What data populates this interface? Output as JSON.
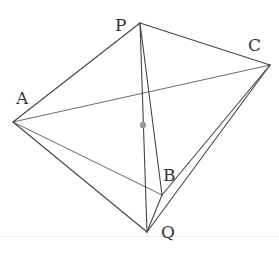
{
  "diagram": {
    "type": "geometry-figure",
    "vertices": {
      "A": {
        "label": "A",
        "x": 13,
        "y": 122,
        "label_x": 16,
        "label_y": 104
      },
      "P": {
        "label": "P",
        "x": 140,
        "y": 23,
        "label_x": 115,
        "label_y": 31
      },
      "C": {
        "label": "C",
        "x": 270,
        "y": 65,
        "label_x": 248,
        "label_y": 51
      },
      "B": {
        "label": "B",
        "x": 162,
        "y": 195,
        "label_x": 163,
        "label_y": 181
      },
      "Q": {
        "label": "Q",
        "x": 147,
        "y": 232,
        "label_x": 161,
        "label_y": 238
      }
    },
    "edges": [
      {
        "from": "A",
        "to": "P",
        "style": "solid"
      },
      {
        "from": "P",
        "to": "C",
        "style": "solid"
      },
      {
        "from": "A",
        "to": "Q",
        "style": "solid"
      },
      {
        "from": "A",
        "to": "C",
        "style": "thin"
      },
      {
        "from": "A",
        "to": "B",
        "style": "thin"
      },
      {
        "from": "P",
        "to": "B",
        "style": "solid"
      },
      {
        "from": "P",
        "to": "Q",
        "style": "solid"
      },
      {
        "from": "B",
        "to": "Q",
        "style": "solid"
      },
      {
        "from": "B",
        "to": "C",
        "style": "solid"
      },
      {
        "from": "Q",
        "to": "C",
        "style": "solid"
      }
    ],
    "marked_point": {
      "on_segment": "PQ",
      "x": 143,
      "y": 125,
      "color": "#999999"
    },
    "line_color": "#444444"
  }
}
